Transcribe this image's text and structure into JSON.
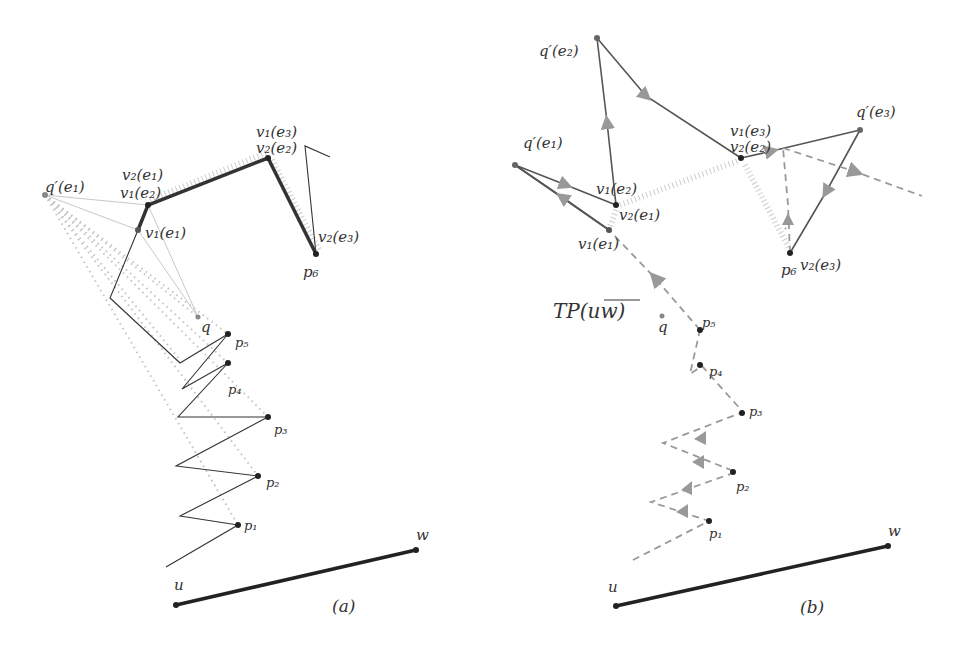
{
  "panels": [
    {
      "id": "a",
      "caption": "(a)",
      "labels": {
        "q_prime_e1": "q′(e₁)",
        "v2_e1": "v₂(e₁)",
        "v1_e2": "v₁(e₂)",
        "v1_e1": "v₁(e₁)",
        "v1_e3": "v₁(e₃)",
        "v2_e2": "v₂(e₂)",
        "v2_e3": "v₂(e₃)",
        "p6": "p₆",
        "q": "q",
        "p5": "p₅",
        "p4": "p₄",
        "p3": "p₃",
        "p2": "p₂",
        "p1": "p₁",
        "u": "u",
        "w": "w"
      }
    },
    {
      "id": "b",
      "caption": "(b)",
      "labels": {
        "q_prime_e2": "q′(e₂)",
        "q_prime_e1": "q′(e₁)",
        "q_prime_e3": "q′(e₃)",
        "v1_e3": "v₁(e₃)",
        "v2_e2": "v₂(e₂)",
        "v1_e2": "v₁(e₂)",
        "v2_e1": "v₂(e₁)",
        "v1_e1": "v₁(e₁)",
        "p6": "p₆",
        "v2_e3": "v₂(e₃)",
        "tp": "TP(uw)",
        "q": "q",
        "p5": "p₅",
        "p4": "p₄",
        "p3": "p₃",
        "p2": "p₂",
        "p1": "p₁",
        "u": "u",
        "w": "w"
      }
    }
  ],
  "colors": {
    "dark": "#222222",
    "thick": "#333333",
    "gray": "#777777",
    "light_gray": "#bbbbbb",
    "arrow": "#888888"
  }
}
